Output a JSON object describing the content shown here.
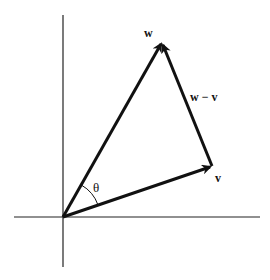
{
  "diagram": {
    "colors": {
      "background": "#ffffff",
      "ink": "#111111",
      "axis": "#222222"
    },
    "origin": {
      "x": 63,
      "y": 217
    },
    "axes": {
      "horizontal": {
        "x1": 14,
        "y1": 217,
        "x2": 260,
        "y2": 217
      },
      "vertical": {
        "x1": 63,
        "y1": 15,
        "x2": 63,
        "y2": 267
      }
    },
    "vectors": [
      {
        "id": "w",
        "label": "w",
        "from": [
          63,
          217
        ],
        "to": [
          162,
          42
        ],
        "label_pos": [
          146,
          36
        ]
      },
      {
        "id": "v",
        "label": "v",
        "from": [
          63,
          217
        ],
        "to": [
          212,
          166
        ],
        "label_pos": [
          215,
          181
        ]
      },
      {
        "id": "w-minus-v",
        "label": "w − v",
        "from": [
          212,
          166
        ],
        "to": [
          162,
          42
        ],
        "label_pos": [
          190,
          100
        ]
      }
    ],
    "angle": {
      "label": "θ",
      "between": [
        "v",
        "w"
      ],
      "label_pos": [
        93,
        191
      ]
    }
  }
}
